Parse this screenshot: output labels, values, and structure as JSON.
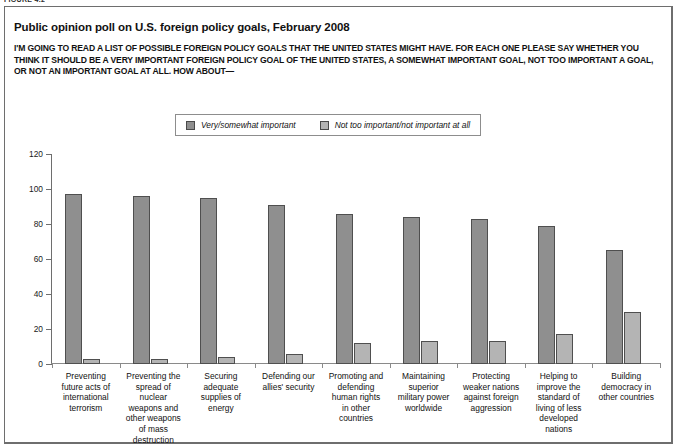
{
  "figure": {
    "tag": "FIGURE 4.2"
  },
  "chart_title": "Public opinion poll on U.S. foreign policy goals, February 2008",
  "chart_subtitle": "I'M GOING TO READ A LIST OF POSSIBLE FOREIGN POLICY GOALS THAT THE UNITED STATES MIGHT HAVE. FOR EACH ONE PLEASE SAY WHETHER YOU THINK IT SHOULD BE A VERY IMPORTANT FOREIGN POLICY GOAL OF THE UNITED STATES, A SOMEWHAT IMPORTANT GOAL, NOT TOO IMPORTANT A GOAL, OR NOT AN IMPORTANT GOAL AT ALL. HOW ABOUT—",
  "colors": {
    "series_primary": "#8f8f8f",
    "series_secondary": "#b4b4b4",
    "bar_outline": "#4f4f4f",
    "axis": "#6e6e6e",
    "frame": "#6e6e6e",
    "text": "#111111"
  },
  "chart_data": {
    "type": "bar",
    "title": "Public opinion poll on U.S. foreign policy goals, February 2008",
    "subtitle": "I'M GOING TO READ A LIST OF POSSIBLE FOREIGN POLICY GOALS THAT THE UNITED STATES MIGHT HAVE. FOR EACH ONE PLEASE SAY WHETHER YOU THINK IT SHOULD BE A VERY IMPORTANT FOREIGN POLICY GOAL OF THE UNITED STATES, A SOMEWHAT IMPORTANT GOAL, NOT TOO IMPORTANT A GOAL, OR NOT AN IMPORTANT GOAL AT ALL. HOW ABOUT—",
    "xlabel": "",
    "ylabel": "",
    "ylim": [
      0,
      120
    ],
    "yticks": [
      0,
      20,
      40,
      60,
      80,
      100,
      120
    ],
    "ytick_labels": [
      "0",
      "20",
      "40",
      "60",
      "80",
      "100",
      "120"
    ],
    "grid": false,
    "legend_position": "top-center",
    "categories": [
      "Preventing future acts of international terrorism",
      "Preventing the spread of nuclear weapons and other weapons of mass destruction",
      "Securing adequate supplies of energy",
      "Defending our allies' security",
      "Promoting and defending human rights in other countries",
      "Maintaining superior military power worldwide",
      "Protecting weaker nations against foreign aggression",
      "Helping to improve the standard of living of less developed nations",
      "Building democracy in other countries"
    ],
    "category_lines": [
      [
        "Preventing",
        "future acts of",
        "international",
        "terrorism"
      ],
      [
        "Preventing the",
        "spread of",
        "nuclear",
        "weapons and",
        "other weapons",
        "of mass",
        "destruction"
      ],
      [
        "Securing",
        "adequate",
        "supplies of",
        "energy"
      ],
      [
        "Defending our",
        "allies' security"
      ],
      [
        "Promoting and",
        "defending",
        "human rights",
        "in other",
        "countries"
      ],
      [
        "Maintaining",
        "superior",
        "military power",
        "worldwide"
      ],
      [
        "Protecting",
        "weaker nations",
        "against foreign",
        "aggression"
      ],
      [
        "Helping to",
        "improve the",
        "standard of",
        "living of less",
        "developed",
        "nations"
      ],
      [
        "Building",
        "democracy in",
        "other countries"
      ]
    ],
    "series": [
      {
        "name": "Very/somewhat important",
        "color": "#8f8f8f",
        "values": [
          97,
          96,
          95,
          91,
          86,
          84,
          83,
          79,
          65
        ]
      },
      {
        "name": "Not too important/not important at all",
        "color": "#b4b4b4",
        "values": [
          3,
          3,
          4,
          6,
          12,
          13,
          13,
          17,
          30
        ]
      }
    ]
  }
}
